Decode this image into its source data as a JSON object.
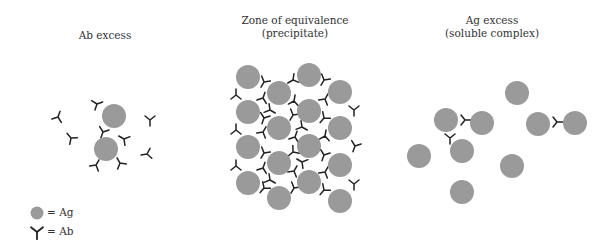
{
  "colors": {
    "antigen": "#9a9a9a",
    "antibody": "#222222",
    "background": "#ffffff"
  },
  "antigen_radius": 12,
  "panels": [
    {
      "id": "ab-excess",
      "title_lines": [
        "Ab excess"
      ],
      "title_x": 105,
      "title_y": 29,
      "antigens": [
        [
          114,
          116
        ],
        [
          106,
          149
        ]
      ],
      "antibodies": [
        [
          58,
          117,
          200
        ],
        [
          71,
          138,
          140
        ],
        [
          150,
          120,
          0
        ],
        [
          147,
          154,
          80
        ],
        [
          97,
          104,
          250
        ],
        [
          103,
          132,
          20
        ],
        [
          124,
          139,
          120
        ],
        [
          96,
          165,
          210
        ],
        [
          120,
          163,
          150
        ]
      ]
    },
    {
      "id": "equivalence",
      "title_lines": [
        "Zone of equivalence",
        "(precipitate)"
      ],
      "title_x": 295,
      "title_y": 15,
      "antigens": [
        [
          248,
          77
        ],
        [
          248,
          112
        ],
        [
          248,
          147
        ],
        [
          248,
          183
        ],
        [
          279,
          93
        ],
        [
          279,
          128
        ],
        [
          279,
          163
        ],
        [
          279,
          198
        ],
        [
          309,
          75
        ],
        [
          309,
          111
        ],
        [
          309,
          146
        ],
        [
          309,
          182
        ],
        [
          340,
          92
        ],
        [
          340,
          128
        ],
        [
          340,
          165
        ],
        [
          340,
          201
        ]
      ],
      "antibodies": [
        [
          264,
          82,
          30
        ],
        [
          263,
          98,
          200
        ],
        [
          236,
          95,
          180
        ],
        [
          264,
          118,
          20
        ],
        [
          263,
          132,
          210
        ],
        [
          236,
          130,
          180
        ],
        [
          264,
          153,
          30
        ],
        [
          263,
          168,
          200
        ],
        [
          236,
          166,
          180
        ],
        [
          264,
          188,
          40
        ],
        [
          293,
          80,
          60
        ],
        [
          294,
          101,
          190
        ],
        [
          293,
          115,
          30
        ],
        [
          295,
          137,
          200
        ],
        [
          293,
          152,
          50
        ],
        [
          294,
          171,
          210
        ],
        [
          294,
          188,
          30
        ],
        [
          324,
          80,
          30
        ],
        [
          325,
          99,
          210
        ],
        [
          324,
          118,
          40
        ],
        [
          325,
          136,
          190
        ],
        [
          324,
          155,
          20
        ],
        [
          325,
          172,
          210
        ],
        [
          324,
          190,
          40
        ],
        [
          354,
          110,
          0
        ],
        [
          355,
          146,
          20
        ],
        [
          354,
          184,
          0
        ],
        [
          270,
          110,
          300
        ],
        [
          302,
          127,
          300
        ],
        [
          270,
          180,
          300
        ],
        [
          302,
          162,
          120
        ]
      ]
    },
    {
      "id": "ag-excess",
      "title_lines": [
        "Ag excess",
        "(soluble complex)"
      ],
      "title_x": 492,
      "title_y": 15,
      "antigens": [
        [
          446,
          120
        ],
        [
          482,
          123
        ],
        [
          517,
          93
        ],
        [
          538,
          124
        ],
        [
          575,
          123
        ],
        [
          419,
          156
        ],
        [
          462,
          151
        ],
        [
          512,
          166
        ],
        [
          462,
          192
        ]
      ],
      "antibodies": [
        [
          465,
          120,
          270
        ],
        [
          450,
          138,
          0
        ],
        [
          557,
          122,
          270
        ]
      ]
    }
  ],
  "legend": {
    "items": [
      {
        "symbol": "antigen",
        "label": "= Ag",
        "x": 37,
        "y": 213
      },
      {
        "symbol": "antibody",
        "label": "= Ab",
        "x": 37,
        "y": 232
      }
    ]
  }
}
